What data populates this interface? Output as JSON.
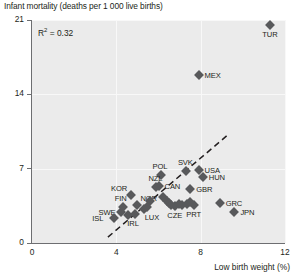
{
  "chart_data": {
    "type": "scatter",
    "title": "Infant mortality (deaths per 1 000 live births)",
    "xlabel": "Low birth weight (%)",
    "ylabel": "Infant mortality (deaths per 1 000 live births)",
    "xlim": [
      0,
      12
    ],
    "ylim": [
      0,
      21
    ],
    "xticks": [
      0,
      4,
      8,
      12
    ],
    "yticks": [
      0,
      7,
      14,
      21
    ],
    "grid": true,
    "annotation": "R² = 0.32",
    "r_squared": 0.32,
    "trendline": {
      "type": "dashed-linear",
      "x_start": 3.6,
      "y_start": 0.55,
      "x_end": 9.3,
      "y_end": 10.2
    },
    "points": [
      {
        "label": "TUR",
        "x": 11.3,
        "y": 20.5,
        "label_pos": "below"
      },
      {
        "label": "MEX",
        "x": 7.9,
        "y": 15.8,
        "label_pos": "right"
      },
      {
        "label": "POL",
        "x": 6.1,
        "y": 6.4,
        "label_pos": "above"
      },
      {
        "label": "SVK",
        "x": 7.3,
        "y": 6.8,
        "label_pos": "above"
      },
      {
        "label": "USA",
        "x": 7.9,
        "y": 6.9,
        "label_pos": "right"
      },
      {
        "label": "HUN",
        "x": 8.1,
        "y": 6.2,
        "label_pos": "right"
      },
      {
        "label": "CAN",
        "x": 6.0,
        "y": 5.4,
        "label_pos": "right"
      },
      {
        "label": "GBR",
        "x": 7.5,
        "y": 5.1,
        "label_pos": "right"
      },
      {
        "label": "KOR",
        "x": 4.7,
        "y": 4.5,
        "label_pos": "above-left"
      },
      {
        "label": "NZL",
        "x": 5.9,
        "y": 5.3,
        "label_pos": "above"
      },
      {
        "label": "NOR",
        "x": 5.0,
        "y": 3.6,
        "label_pos": "above-right"
      },
      {
        "label": "SWE",
        "x": 4.2,
        "y": 2.9,
        "label_pos": "left"
      },
      {
        "label": "FIN",
        "x": 4.3,
        "y": 3.4,
        "label_pos": "above"
      },
      {
        "label": "ISL",
        "x": 3.9,
        "y": 2.4,
        "label_pos": "left"
      },
      {
        "label": "IRL",
        "x": 4.9,
        "y": 2.7,
        "label_pos": "below"
      },
      {
        "label": "LUX",
        "x": 5.3,
        "y": 3.2,
        "label_pos": "below-right"
      },
      {
        "label": "CZE",
        "x": 6.8,
        "y": 3.5,
        "label_pos": "below"
      },
      {
        "label": "PRT",
        "x": 7.7,
        "y": 3.6,
        "label_pos": "below"
      },
      {
        "label": "GRC",
        "x": 8.9,
        "y": 3.8,
        "label_pos": "right"
      },
      {
        "label": "JPN",
        "x": 9.6,
        "y": 2.9,
        "label_pos": "right"
      },
      {
        "label": "",
        "x": 6.2,
        "y": 4.3,
        "label_pos": "none"
      },
      {
        "label": "",
        "x": 6.4,
        "y": 4.0,
        "label_pos": "none"
      },
      {
        "label": "",
        "x": 6.5,
        "y": 3.8,
        "label_pos": "none"
      },
      {
        "label": "",
        "x": 6.6,
        "y": 3.6,
        "label_pos": "none"
      },
      {
        "label": "",
        "x": 6.95,
        "y": 3.7,
        "label_pos": "none"
      },
      {
        "label": "",
        "x": 7.1,
        "y": 3.6,
        "label_pos": "none"
      },
      {
        "label": "",
        "x": 7.35,
        "y": 3.7,
        "label_pos": "none"
      },
      {
        "label": "",
        "x": 7.5,
        "y": 3.9,
        "label_pos": "none"
      },
      {
        "label": "",
        "x": 5.6,
        "y": 4.0,
        "label_pos": "none"
      },
      {
        "label": "",
        "x": 5.45,
        "y": 3.4,
        "label_pos": "none"
      },
      {
        "label": "",
        "x": 4.55,
        "y": 2.6,
        "label_pos": "none"
      }
    ]
  }
}
